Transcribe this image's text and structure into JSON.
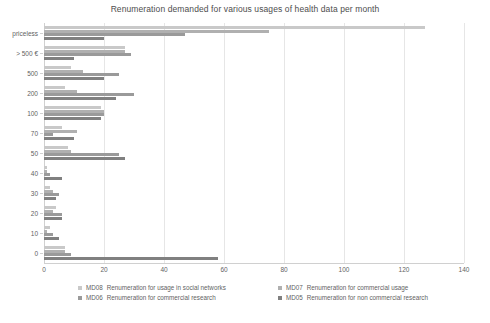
{
  "chart_data": {
    "type": "bar",
    "orientation": "horizontal",
    "title": "Renumeration demanded for various usages of health data per month",
    "xlabel": "",
    "ylabel": "",
    "xlim": [
      0,
      140
    ],
    "xticks": [
      0,
      20,
      40,
      60,
      80,
      100,
      120,
      140
    ],
    "grid": true,
    "legend_position": "bottom",
    "categories": [
      "priceless",
      "> 500 €",
      "500",
      "200",
      "100",
      "70",
      "50",
      "40",
      "30",
      "20",
      "10",
      "0"
    ],
    "series": [
      {
        "name": "MD08  Renumeration for usage in social networks",
        "code": "MD08",
        "label": "Renumeration for usage in social networks",
        "color": "#c9c9c9",
        "values": [
          127,
          27,
          9,
          7,
          19,
          6,
          8,
          1,
          2,
          4,
          2,
          7
        ]
      },
      {
        "name": "MD07  Renumeration for commercial usage",
        "code": "MD07",
        "label": "Renumeration for commercial usage",
        "color": "#b0b0b0",
        "values": [
          75,
          27,
          13,
          11,
          20,
          11,
          9,
          1,
          3,
          3,
          1,
          7
        ]
      },
      {
        "name": "MD06  Renumeration for commercial research",
        "code": "MD06",
        "label": "Renumeration for commercial research",
        "color": "#9a9a9a",
        "values": [
          47,
          29,
          25,
          30,
          20,
          3,
          25,
          2,
          5,
          6,
          3,
          9
        ]
      },
      {
        "name": "MD05  Renumeration for non commercial research",
        "code": "MD05",
        "label": "Renumeration for non commercial research",
        "color": "#808080",
        "values": [
          20,
          10,
          20,
          24,
          19,
          10,
          27,
          6,
          4,
          6,
          5,
          58
        ]
      }
    ]
  }
}
